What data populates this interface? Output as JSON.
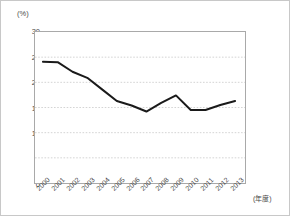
{
  "chart_data": {
    "type": "line",
    "title": "",
    "xlabel": "(年度)",
    "ylabel": "(%)",
    "ylim": [
      0,
      30
    ],
    "yticks": [
      "0",
      "5",
      "10",
      "15",
      "20",
      "25",
      "30"
    ],
    "ytick_values": [
      0,
      5,
      10,
      15,
      20,
      25,
      30
    ],
    "grid": true,
    "grid_axis": "y",
    "legend": false,
    "categories": [
      "2000",
      "2001",
      "2002",
      "2003",
      "2004",
      "2005",
      "2006",
      "2007",
      "2008",
      "2009",
      "2010",
      "2011",
      "2012",
      "2013"
    ],
    "values": [
      24.1,
      24.0,
      22.1,
      20.9,
      18.6,
      16.3,
      15.4,
      14.2,
      15.9,
      17.4,
      14.5,
      14.5,
      15.5,
      16.3
    ],
    "series": [
      {
        "name": "",
        "values": [
          24.1,
          24.0,
          22.1,
          20.9,
          18.6,
          16.3,
          15.4,
          14.2,
          15.9,
          17.4,
          14.5,
          14.5,
          15.5,
          16.3
        ]
      }
    ],
    "line_color": "#1a1a1a",
    "grid_color": "#c0c0c0",
    "axis_color": "#a9a9a9",
    "text_color": "#4a4a4a"
  }
}
